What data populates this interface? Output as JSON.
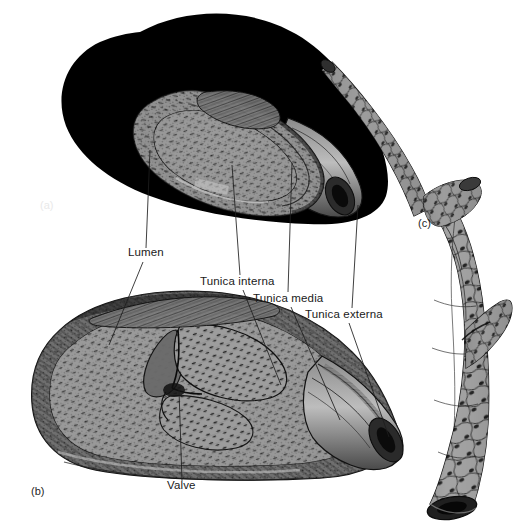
{
  "figure": {
    "background_color": "#ffffff",
    "ink_color": "#1a1a1a",
    "silhouette_color": "#000000",
    "tissue_mid_tone": "#8d8d8d",
    "tissue_dark_tone": "#3a3a3a",
    "tissue_light_tone": "#c9c9c9"
  },
  "panels": [
    {
      "id": "a",
      "tag": "(a)",
      "name": "artery-cross-section",
      "tag_x": 40,
      "tag_y": 207
    },
    {
      "id": "b",
      "tag": "(b)",
      "name": "vein-with-valve",
      "tag_x": 31,
      "tag_y": 493
    },
    {
      "id": "c",
      "tag": "(c)",
      "name": "capillary-branch",
      "tag_x": 418,
      "tag_y": 225
    }
  ],
  "labels": [
    {
      "id": "lumen",
      "text": "Lumen",
      "x": 128,
      "y": 254,
      "leaders": [
        {
          "from": [
            146,
            248
          ],
          "to": [
            150,
            150
          ]
        },
        {
          "from": [
            143,
            262
          ],
          "to": [
            109,
            345
          ]
        }
      ]
    },
    {
      "id": "tunica-interna",
      "text": "Tunica interna",
      "x": 200,
      "y": 283,
      "leaders": [
        {
          "from": [
            240,
            275
          ],
          "to": [
            232,
            165
          ]
        },
        {
          "from": [
            243,
            290
          ],
          "to": [
            281,
            385
          ]
        }
      ]
    },
    {
      "id": "tunica-media",
      "text": "Tunica media",
      "x": 253,
      "y": 300,
      "leaders": [
        {
          "from": [
            288,
            292
          ],
          "to": [
            292,
            163
          ]
        },
        {
          "from": [
            291,
            307
          ],
          "to": [
            340,
            420
          ]
        }
      ]
    },
    {
      "id": "tunica-externa",
      "text": "Tunica externa",
      "x": 305,
      "y": 316,
      "leaders": [
        {
          "from": [
            352,
            308
          ],
          "to": [
            358,
            205
          ]
        },
        {
          "from": [
            349,
            323
          ],
          "to": [
            389,
            437
          ]
        }
      ]
    },
    {
      "id": "valve",
      "text": "Valve",
      "x": 167,
      "y": 487,
      "leaders": [
        {
          "from": [
            182,
            481
          ],
          "to": [
            179,
            390
          ]
        }
      ]
    }
  ]
}
